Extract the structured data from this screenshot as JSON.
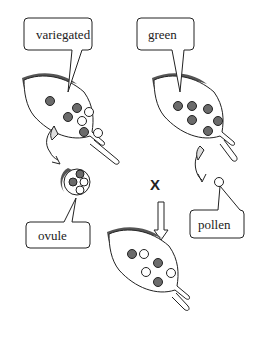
{
  "diagram": {
    "type": "inheritance-cross-illustration",
    "labels": {
      "variegated": "variegated",
      "green": "green",
      "ovule": "ovule",
      "pollen": "pollen",
      "cross_symbol": "X"
    },
    "colors": {
      "green_plastid": "#6b6b6b",
      "white_plastid": "#ffffff",
      "leaf_edge_shadow": "#555555",
      "outline": "#222222"
    },
    "leaves": {
      "variegated_parent": {
        "green_plastids": 4,
        "white_plastids": 3
      },
      "green_parent": {
        "green_plastids": 6,
        "white_plastids": 0
      },
      "offspring": {
        "green_plastids": 3,
        "white_plastids": 3
      }
    },
    "ovule": {
      "green_plastids": 2,
      "white_plastids": 2
    },
    "pollen": {
      "green_plastids": 0,
      "white_plastids": 0
    }
  }
}
